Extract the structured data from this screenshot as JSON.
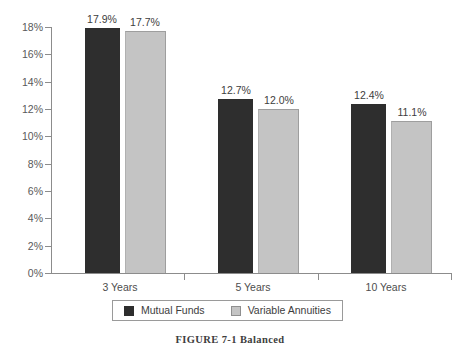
{
  "chart_data": {
    "type": "bar",
    "title": "",
    "xlabel": "",
    "ylabel": "",
    "categories": [
      "3 Years",
      "5 Years",
      "10 Years"
    ],
    "series": [
      {
        "name": "Mutual Funds",
        "color": "#2e2e2e",
        "values": [
          17.9,
          17.7,
          12.7
        ]
      },
      {
        "name": "Variable Annuities",
        "color": "#c4c4c4",
        "values": [
          0,
          0,
          0
        ]
      }
    ],
    "grouped_values": {
      "Mutual Funds": [
        17.9,
        12.7,
        12.4
      ],
      "Variable Annuities": [
        17.7,
        12.0,
        11.1
      ]
    },
    "value_labels": [
      [
        "17.9%",
        "17.7%"
      ],
      [
        "12.7%",
        "12.0%"
      ],
      [
        "12.4%",
        "11.1%"
      ]
    ],
    "ylim": [
      0,
      18
    ],
    "ytick_step": 2,
    "ytick_labels": [
      "0%",
      "2%",
      "4%",
      "6%",
      "8%",
      "10%",
      "12%",
      "14%",
      "16%",
      "18%"
    ],
    "ytick_values": [
      0,
      2,
      4,
      6,
      8,
      10,
      12,
      14,
      16,
      18
    ],
    "grid": false,
    "legend_position": "bottom-center",
    "axis_color": "#8c8c8c"
  },
  "legend": {
    "entries": [
      {
        "label": "Mutual Funds",
        "color": "#2e2e2e"
      },
      {
        "label": "Variable Annuities",
        "color": "#c4c4c4"
      }
    ]
  },
  "caption": {
    "text": "FIGURE 7-1  Balanced"
  }
}
